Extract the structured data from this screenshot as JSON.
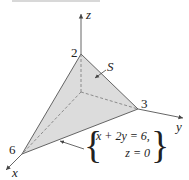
{
  "figure": {
    "surface_label": "S",
    "axes": {
      "x": "x",
      "y": "y",
      "z": "z"
    },
    "intercepts": {
      "x": "6",
      "y": "3",
      "z": "2"
    },
    "boundary_equation": {
      "line1": "x + 2y = 6,",
      "line2": "z = 0"
    },
    "colors": {
      "surface_fill": "#dcdcdc",
      "edge": "#555555",
      "axis": "#555555",
      "dashed": "#777777",
      "top_rule": "#d8d8d8"
    }
  }
}
